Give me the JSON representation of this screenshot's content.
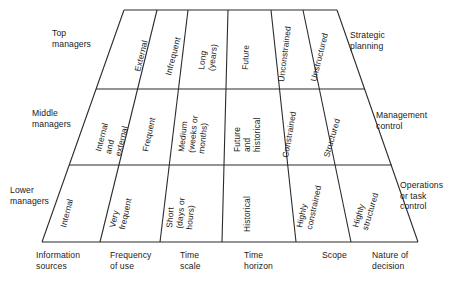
{
  "diagram": {
    "ink_color": "#2b2b2b",
    "background": "#ffffff",
    "left_labels": [
      {
        "id": "top-managers",
        "text": "Top\nmanagers"
      },
      {
        "id": "middle-managers",
        "text": "Middle\nmanagers"
      },
      {
        "id": "lower-managers",
        "text": "Lower\nmanagers"
      }
    ],
    "right_labels": [
      {
        "id": "strategic-planning",
        "text": "Strategic\nplanning"
      },
      {
        "id": "management-control",
        "text": "Management\ncontrol"
      },
      {
        "id": "operations-or-task-control",
        "text": "Operations\nor task\ncontrol"
      }
    ],
    "columns": [
      {
        "id": "information-sources",
        "text": "Information\nsources"
      },
      {
        "id": "frequency-of-use",
        "text": "Frequency\nof use"
      },
      {
        "id": "time-scale",
        "text": "Time\nscale"
      },
      {
        "id": "time-horizon",
        "text": "Time\nhorizon"
      },
      {
        "id": "scope",
        "text": "Scope"
      },
      {
        "id": "nature-of-decision",
        "text": "Nature of\ndecision"
      }
    ],
    "rows": [
      {
        "id": "row-top",
        "cells": [
          {
            "id": "cell-top-information-sources",
            "lines": [
              "External"
            ]
          },
          {
            "id": "cell-top-frequency-of-use",
            "lines": [
              "Infrequent"
            ]
          },
          {
            "id": "cell-top-time-scale",
            "lines": [
              "Long",
              "(years)"
            ]
          },
          {
            "id": "cell-top-time-horizon",
            "lines": [
              "Future"
            ]
          },
          {
            "id": "cell-top-scope",
            "lines": [
              "Unconstrained"
            ]
          },
          {
            "id": "cell-top-nature-of-decision",
            "lines": [
              "Unstructured"
            ]
          }
        ]
      },
      {
        "id": "row-middle",
        "cells": [
          {
            "id": "cell-middle-information-sources",
            "lines": [
              "Internal",
              "and",
              "external"
            ]
          },
          {
            "id": "cell-middle-frequency-of-use",
            "lines": [
              "Frequent"
            ]
          },
          {
            "id": "cell-middle-time-scale",
            "lines": [
              "Medium",
              "(weeks or",
              "months)"
            ]
          },
          {
            "id": "cell-middle-time-horizon",
            "lines": [
              "Future",
              "and",
              "historical"
            ]
          },
          {
            "id": "cell-middle-scope",
            "lines": [
              "Constrained"
            ]
          },
          {
            "id": "cell-middle-nature-of-decision",
            "lines": [
              "Structured"
            ]
          }
        ]
      },
      {
        "id": "row-lower",
        "cells": [
          {
            "id": "cell-lower-information-sources",
            "lines": [
              "Internal"
            ]
          },
          {
            "id": "cell-lower-frequency-of-use",
            "lines": [
              "Very",
              "frequent"
            ]
          },
          {
            "id": "cell-lower-time-scale",
            "lines": [
              "Short",
              "(days or",
              "hours)"
            ]
          },
          {
            "id": "cell-lower-time-horizon",
            "lines": [
              "Historical"
            ]
          },
          {
            "id": "cell-lower-scope",
            "lines": [
              "Highly",
              "constrained"
            ]
          },
          {
            "id": "cell-lower-nature-of-decision",
            "lines": [
              "Highly",
              "structured"
            ]
          }
        ]
      }
    ]
  }
}
